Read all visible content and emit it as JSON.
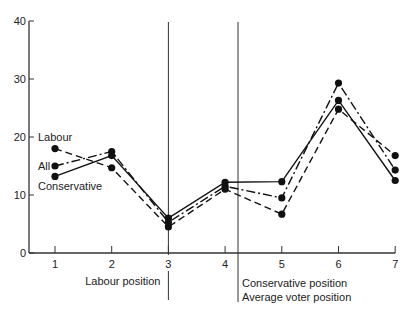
{
  "chart_data": {
    "type": "line",
    "title": "",
    "xlabel": "",
    "ylabel": "",
    "x": [
      1,
      2,
      3,
      4,
      5,
      6,
      7
    ],
    "xlim": [
      0.5,
      7
    ],
    "ylim": [
      0,
      40
    ],
    "yticks": [
      0,
      10,
      20,
      30,
      40
    ],
    "xticks": [
      1,
      2,
      3,
      4,
      5,
      6,
      7
    ],
    "grid": false,
    "series": [
      {
        "name": "Labour",
        "style": "dashed",
        "values": [
          18,
          14.7,
          4.5,
          11,
          6.7,
          24.8,
          16.8
        ]
      },
      {
        "name": "All",
        "style": "dash-dot",
        "values": [
          15,
          17.5,
          5.3,
          11.5,
          9.5,
          29.3,
          14.3
        ]
      },
      {
        "name": "Conservative",
        "style": "solid",
        "values": [
          13.2,
          16.8,
          6,
          12.2,
          12.3,
          26.3,
          12.5
        ]
      }
    ],
    "series_labels": {
      "labour": "Labour",
      "all": "All",
      "conservative": "Conservative"
    },
    "annotations": [
      {
        "x": 3,
        "label": "Labour position"
      },
      {
        "x": 4.2,
        "label": "Conservative position",
        "label2": "Average voter position"
      }
    ]
  }
}
